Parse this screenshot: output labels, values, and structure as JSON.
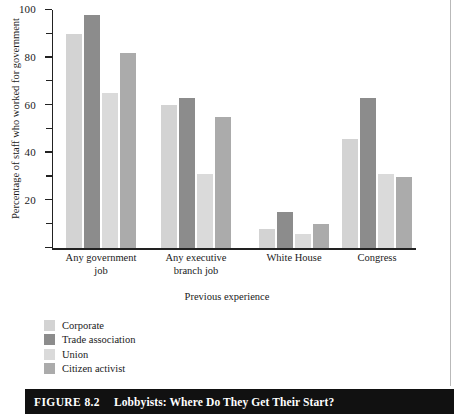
{
  "figure": {
    "caption_number": "FIGURE 8.2",
    "caption_title": "Lobbyists: Where Do They Get Their Start?"
  },
  "chart_data": {
    "type": "bar",
    "title": "",
    "subtitle": "",
    "xlabel": "Previous experience",
    "ylabel": "Percentage of staff who worked for government",
    "categories": [
      "Any government\njob",
      "Any executive\nbranch job",
      "White House",
      "Congress"
    ],
    "series": [
      {
        "name": "Corporate",
        "color": "#d3d3d3",
        "values": [
          90,
          60,
          8,
          46
        ]
      },
      {
        "name": "Trade association",
        "color": "#8c8c8c",
        "values": [
          98,
          63,
          15,
          63
        ]
      },
      {
        "name": "Union",
        "color": "#dadada",
        "values": [
          65,
          31,
          6,
          31
        ]
      },
      {
        "name": "Citizen activist",
        "color": "#ababab",
        "values": [
          82,
          55,
          10,
          30
        ]
      }
    ],
    "ylim": [
      0,
      100
    ],
    "y_major_ticks": [
      0,
      20,
      40,
      60,
      80,
      100
    ],
    "y_major_tick_labels": [
      "",
      "20",
      "40",
      "60",
      "80",
      "100"
    ],
    "y_minor_ticks": [
      10,
      30,
      50,
      70,
      90
    ],
    "grid": false,
    "legend_position": "below-left",
    "xlim_note": "categorical"
  }
}
